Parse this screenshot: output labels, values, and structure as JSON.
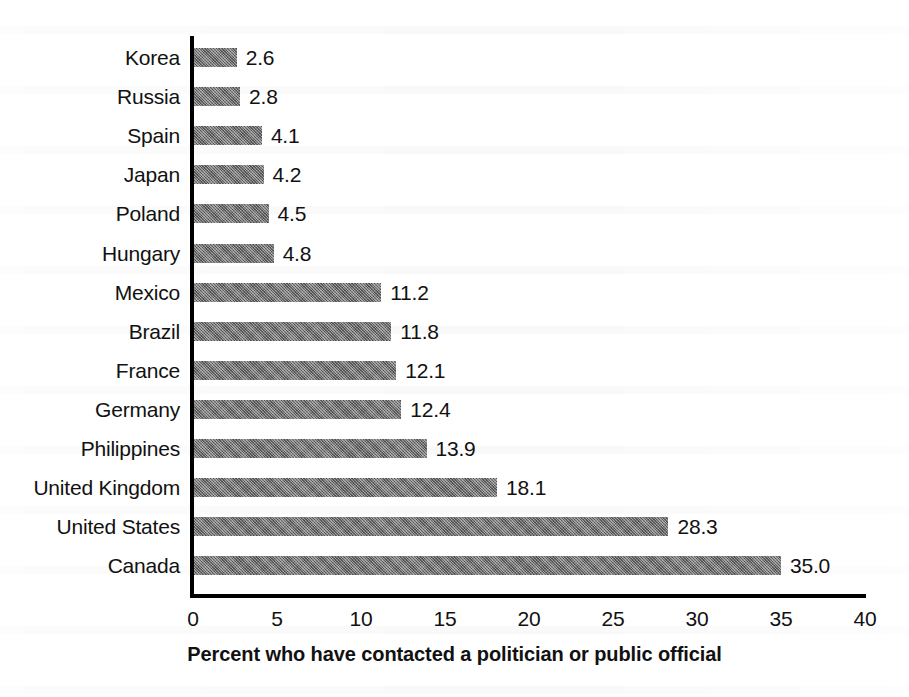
{
  "chart_data": {
    "type": "bar",
    "orientation": "horizontal",
    "title": "",
    "xlabel": "Percent who have contacted a politician or public official",
    "ylabel": "",
    "xlim": [
      0,
      40
    ],
    "xticks": [
      0,
      5,
      10,
      15,
      20,
      25,
      30,
      35,
      40
    ],
    "grid": false,
    "legend": false,
    "bar_color": "#6f6f6f",
    "value_label_format": "one-decimal",
    "categories": [
      "Korea",
      "Russia",
      "Spain",
      "Japan",
      "Poland",
      "Hungary",
      "Mexico",
      "Brazil",
      "France",
      "Germany",
      "Philippines",
      "United Kingdom",
      "United States",
      "Canada"
    ],
    "values": [
      2.6,
      2.8,
      4.1,
      4.2,
      4.5,
      4.8,
      11.2,
      11.8,
      12.1,
      12.4,
      13.9,
      18.1,
      28.3,
      35.0
    ],
    "value_labels": [
      "2.6",
      "2.8",
      "4.1",
      "4.2",
      "4.5",
      "4.8",
      "11.2",
      "11.8",
      "12.1",
      "12.4",
      "13.9",
      "18.1",
      "28.3",
      "35.0"
    ],
    "tick_labels": [
      "0",
      "5",
      "10",
      "15",
      "20",
      "25",
      "30",
      "35",
      "40"
    ]
  }
}
